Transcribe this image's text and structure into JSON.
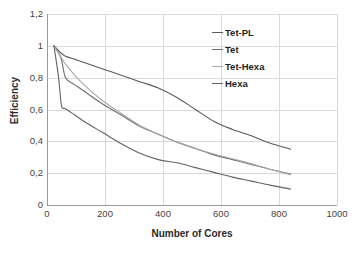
{
  "chart_data": {
    "type": "line",
    "title": "",
    "xlabel": "Number of Cores",
    "ylabel": "Efficiency",
    "xlim": [
      0,
      1000
    ],
    "ylim": [
      0,
      1.2
    ],
    "grid": true,
    "legend_position": "top-right",
    "x_ticks": [
      "0",
      "200",
      "400",
      "600",
      "800",
      "1000"
    ],
    "x_tick_values": [
      0,
      200,
      400,
      600,
      800,
      1000
    ],
    "y_ticks": [
      "0",
      "0,2",
      "0,4",
      "0,6",
      "0,8",
      "1",
      "1,2"
    ],
    "y_tick_values": [
      0,
      0.2,
      0.4,
      0.6,
      0.8,
      1.0,
      1.2
    ],
    "decimal_separator": ",",
    "series": [
      {
        "name": "Tet-PL",
        "color": "#5a5a5a",
        "x": [
          24,
          48,
          64,
          96,
          128,
          192,
          256,
          320,
          384,
          448,
          512,
          576,
          640,
          704,
          768,
          840
        ],
        "y": [
          1.0,
          0.955,
          0.935,
          0.915,
          0.895,
          0.855,
          0.815,
          0.775,
          0.735,
          0.675,
          0.6,
          0.525,
          0.475,
          0.435,
          0.39,
          0.35
        ]
      },
      {
        "name": "Tet",
        "color": "#6e6e6e",
        "x": [
          24,
          48,
          64,
          96,
          128,
          192,
          256,
          320,
          384,
          448,
          512,
          576,
          640,
          704,
          768,
          840
        ],
        "y": [
          1.0,
          0.925,
          0.8,
          0.755,
          0.715,
          0.635,
          0.565,
          0.495,
          0.445,
          0.395,
          0.355,
          0.315,
          0.285,
          0.255,
          0.225,
          0.195
        ]
      },
      {
        "name": "Tet-Hexa",
        "color": "#a8a8a8",
        "x": [
          24,
          48,
          64,
          96,
          128,
          192,
          256,
          320,
          384,
          448,
          512,
          576,
          640,
          704,
          768,
          840
        ],
        "y": [
          1.0,
          0.93,
          0.885,
          0.815,
          0.755,
          0.655,
          0.575,
          0.5,
          0.445,
          0.395,
          0.355,
          0.32,
          0.29,
          0.26,
          0.225,
          0.19
        ]
      },
      {
        "name": "Hexa",
        "color": "#636363",
        "x": [
          24,
          40,
          50,
          64,
          96,
          128,
          192,
          256,
          320,
          384,
          448,
          512,
          576,
          640,
          704,
          768,
          840
        ],
        "y": [
          1.0,
          0.8,
          0.625,
          0.605,
          0.565,
          0.525,
          0.455,
          0.385,
          0.325,
          0.285,
          0.265,
          0.235,
          0.205,
          0.175,
          0.15,
          0.125,
          0.1
        ]
      }
    ]
  },
  "legend": {
    "items": [
      {
        "label": "Tet-PL"
      },
      {
        "label": "Tet"
      },
      {
        "label": "Tet-Hexa"
      },
      {
        "label": "Hexa"
      }
    ]
  },
  "axes": {
    "x_title": "Number of Cores",
    "y_title": "Efficiency"
  }
}
